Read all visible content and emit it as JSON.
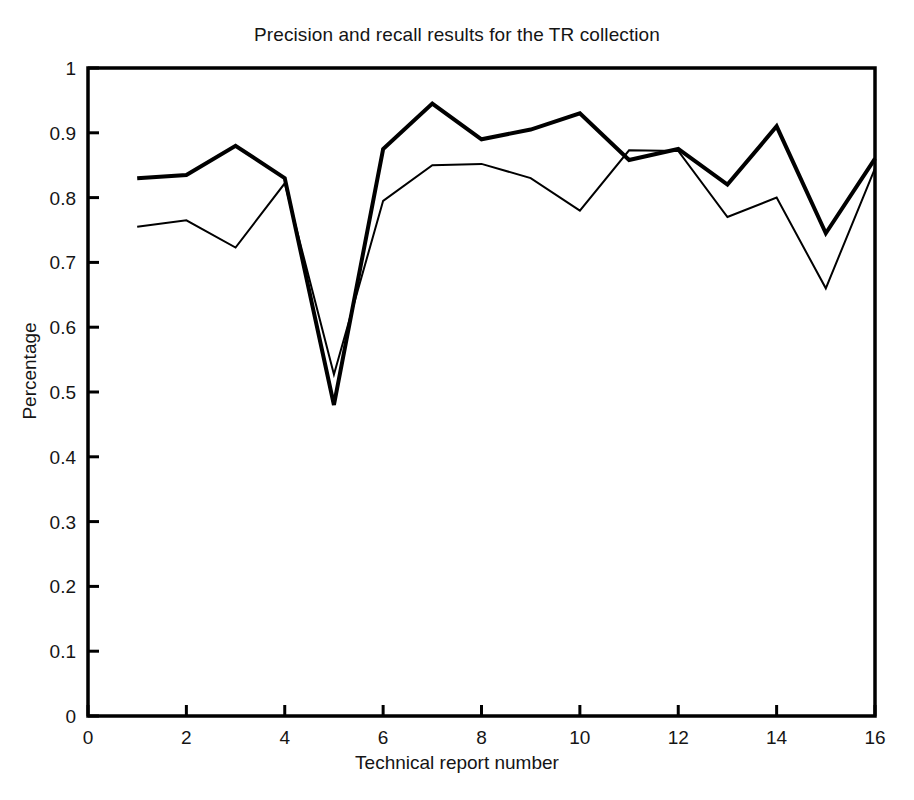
{
  "chart_data": {
    "type": "line",
    "title": "Precision and recall results for the TR collection",
    "xlabel": "Technical report number",
    "ylabel": "Percentage",
    "xlim": [
      0,
      16
    ],
    "ylim": [
      0,
      1
    ],
    "grid": false,
    "legend": "none",
    "xticks": [
      0,
      2,
      4,
      6,
      8,
      10,
      12,
      14,
      16
    ],
    "xticklabels": [
      "0",
      "2",
      "4",
      "6",
      "8",
      "10",
      "12",
      "14",
      "16"
    ],
    "yticks": [
      0,
      0.1,
      0.2,
      0.3,
      0.4,
      0.5,
      0.6,
      0.7,
      0.8,
      0.9,
      1
    ],
    "yticklabels": [
      "0",
      "0.1",
      "0.2",
      "0.3",
      "0.4",
      "0.5",
      "0.6",
      "0.7",
      "0.8",
      "0.9",
      "1"
    ],
    "x": [
      1,
      2,
      3,
      4,
      5,
      6,
      7,
      8,
      9,
      10,
      11,
      12,
      13,
      14,
      15,
      16
    ],
    "series": [
      {
        "name": "precision",
        "color": "#000000",
        "linewidth": 4,
        "values": [
          0.83,
          0.835,
          0.88,
          0.83,
          0.48,
          0.875,
          0.945,
          0.89,
          0.905,
          0.93,
          0.858,
          0.875,
          0.82,
          0.91,
          0.745,
          0.86
        ]
      },
      {
        "name": "recall",
        "color": "#000000",
        "linewidth": 2,
        "values": [
          0.755,
          0.765,
          0.723,
          0.822,
          0.527,
          0.795,
          0.85,
          0.852,
          0.83,
          0.78,
          0.873,
          0.872,
          0.77,
          0.8,
          0.66,
          0.845
        ]
      }
    ]
  },
  "figure": {
    "axis_color": "#000000",
    "background": "#ffffff"
  }
}
